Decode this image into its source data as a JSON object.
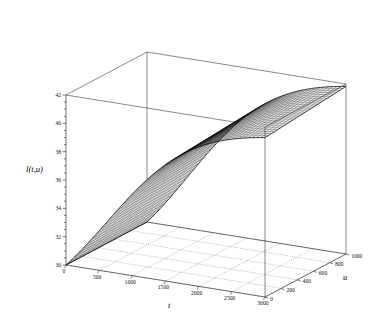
{
  "chart_data": {
    "type": "surface",
    "title": "",
    "xlabel": "t",
    "ylabel": "u",
    "zlabel": "l(t,u)",
    "xlim": [
      0,
      3000
    ],
    "ylim": [
      0,
      1000
    ],
    "zlim": [
      30,
      42
    ],
    "xticks": [
      "0",
      "500",
      "1000",
      "1500",
      "2000",
      "2500",
      "3000"
    ],
    "xtick_values": [
      0,
      500,
      1000,
      1500,
      2000,
      2500,
      3000
    ],
    "yticks": [
      "0",
      "200",
      "400",
      "600",
      "800",
      "1000"
    ],
    "ytick_values": [
      0,
      200,
      400,
      600,
      800,
      1000
    ],
    "zticks": [
      "30",
      "32",
      "34",
      "36",
      "38",
      "40",
      "42"
    ],
    "ztick_values": [
      30,
      32,
      34,
      36,
      38,
      40,
      42
    ],
    "grid": "floor-only-dotted",
    "legend": "none",
    "mesh_style": "wireframe",
    "surface_z_at_t": {
      "t": [
        0,
        250,
        500,
        750,
        1000,
        1250,
        1500,
        1750,
        2000,
        2250,
        2500,
        2750,
        3000
      ],
      "u0": [
        30.0,
        32.6,
        34.6,
        36.2,
        37.4,
        38.4,
        39.2,
        39.8,
        40.3,
        40.6,
        40.9,
        41.1,
        41.2
      ],
      "u500": [
        30.0,
        32.9,
        35.0,
        36.6,
        37.8,
        38.8,
        39.6,
        40.2,
        40.6,
        41.0,
        41.2,
        41.4,
        41.5
      ],
      "u1000": [
        30.0,
        33.2,
        35.3,
        36.9,
        38.1,
        39.1,
        39.9,
        40.5,
        40.9,
        41.3,
        41.5,
        41.7,
        41.8
      ]
    },
    "colors": {
      "line": "#111111",
      "grid": "#555555",
      "background": "#ffffff"
    }
  },
  "axes": {
    "z_axis_name": "l(t,u)",
    "t_axis_name": "t",
    "u_axis_name": "u"
  }
}
